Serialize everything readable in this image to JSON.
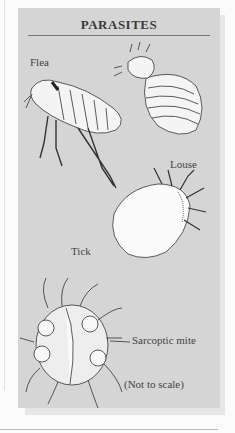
{
  "figure": {
    "title": "PARASITES",
    "labels": {
      "flea": "Flea",
      "louse": "Louse",
      "tick": "Tick",
      "mite": "Sarcoptic mite",
      "note": "(Not to scale)"
    },
    "colors": {
      "panel": "#d5d5d5",
      "title_rule": "#777777",
      "text": "#444444"
    }
  }
}
